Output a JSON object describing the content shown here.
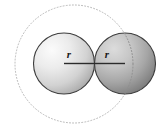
{
  "figure": {
    "background_color": "#ffffff",
    "top_cropped_text": "",
    "labels": {
      "left_radius": "r",
      "right_radius": "r"
    },
    "colors": {
      "outline_stroke": "#3d3d3d",
      "radius_line": "#2b2b2b",
      "dotted_circle": "#b9b9b9",
      "left_fill_light": "#f2f2f2",
      "left_fill_dark": "#9c9c9c",
      "right_fill_light": "#cfcfcf",
      "right_fill_dark": "#6e6e6e",
      "label_color": "#1a1a1a"
    },
    "geometry": {
      "small_circle_radius_px": 30.5,
      "large_dotted_circle_radius_px": 59,
      "left_circle_center": [
        64,
        63.5
      ],
      "right_circle_center": [
        125,
        63.5
      ],
      "dotted_circle_center": [
        74,
        64
      ],
      "tangent_point": [
        94.5,
        63.5
      ],
      "left_radius_line": {
        "x1": 64,
        "y1": 63.5,
        "x2": 94.5,
        "y2": 63.5
      },
      "right_radius_line": {
        "x1": 125,
        "y1": 63.5,
        "x2": 94.5,
        "y2": 63.5
      },
      "left_label_pos": [
        69,
        57
      ],
      "right_label_pos": [
        107,
        57
      ]
    }
  }
}
